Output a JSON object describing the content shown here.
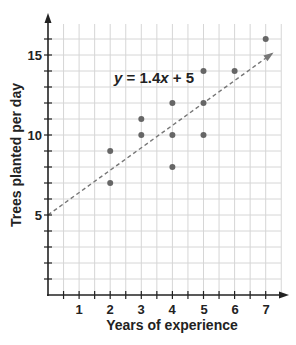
{
  "chart_data": {
    "type": "scatter",
    "title": "",
    "xlabel": "Years of experience",
    "ylabel": "Trees planted per day",
    "xlim": [
      0,
      7.5
    ],
    "ylim": [
      0,
      17
    ],
    "x_ticks": [
      1,
      2,
      3,
      4,
      5,
      6,
      7
    ],
    "y_ticks_labeled": [
      5,
      10,
      15
    ],
    "grid": true,
    "grid_step": {
      "x": 0.5,
      "y": 1
    },
    "series": [
      {
        "name": "data",
        "points": [
          {
            "x": 2,
            "y": 9
          },
          {
            "x": 2,
            "y": 7
          },
          {
            "x": 3,
            "y": 11
          },
          {
            "x": 3,
            "y": 10
          },
          {
            "x": 4,
            "y": 12
          },
          {
            "x": 4,
            "y": 10
          },
          {
            "x": 4,
            "y": 8
          },
          {
            "x": 5,
            "y": 14
          },
          {
            "x": 5,
            "y": 12
          },
          {
            "x": 5,
            "y": 10
          },
          {
            "x": 6,
            "y": 14
          },
          {
            "x": 7,
            "y": 16
          }
        ]
      }
    ],
    "trend_line": {
      "equation": "y = 1.4x + 5",
      "slope": 1.4,
      "intercept": 5,
      "style": "dashed",
      "x_start": 0,
      "x_end": 7.2
    },
    "annotations": [
      {
        "text": "y = 1.4x + 5",
        "x": 2.1,
        "y": 13.2
      }
    ]
  },
  "labels": {
    "xlabel": "Years of experience",
    "ylabel": "Trees planted per day",
    "eq_y": "y",
    "eq_mid": " = 1.4",
    "eq_x": "x",
    "eq_end": " + 5",
    "xt1": "1",
    "xt2": "2",
    "xt3": "3",
    "xt4": "4",
    "xt5": "5",
    "xt6": "6",
    "xt7": "7",
    "yt5": "5",
    "yt10": "10",
    "yt15": "15"
  },
  "colors": {
    "axis": "#222222",
    "grid": "#d6d6d6",
    "point": "#666666",
    "trend": "#777777"
  }
}
